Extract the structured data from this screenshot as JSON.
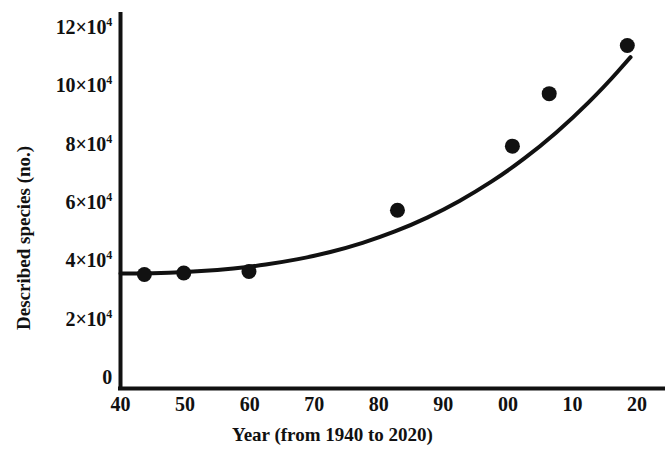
{
  "chart_data": {
    "type": "scatter",
    "title": "",
    "subtitle": "",
    "xlabel": "Year (from 1940 to 2020)",
    "ylabel": "Described species (no.)",
    "xlim": [
      40,
      120
    ],
    "ylim": [
      0,
      125000
    ],
    "grid": false,
    "legend": null,
    "x_tick_labels": [
      "40",
      "50",
      "60",
      "70",
      "80",
      "90",
      "00",
      "10",
      "20"
    ],
    "x_tick_values": [
      40,
      50,
      60,
      70,
      80,
      90,
      100,
      110,
      120
    ],
    "y_tick_labels": [
      "0",
      "2×10",
      "4×10",
      "6×10",
      "8×10",
      "10×10",
      "12×10"
    ],
    "y_tick_values": [
      0,
      20000,
      40000,
      60000,
      80000,
      100000,
      120000
    ],
    "y_tick_exponent": "4",
    "series": [
      {
        "name": "Described species",
        "marker": "filled-circle",
        "color": "#111111",
        "points": [
          {
            "x": 43.7,
            "y": 35500,
            "year": 1943
          },
          {
            "x": 49.8,
            "y": 36000,
            "year": 1950
          },
          {
            "x": 59.9,
            "y": 36500,
            "year": 1960
          },
          {
            "x": 82.9,
            "y": 57500,
            "year": 1983
          },
          {
            "x": 100.7,
            "y": 79500,
            "year": 2001
          },
          {
            "x": 106.4,
            "y": 97500,
            "year": 2006
          },
          {
            "x": 118.5,
            "y": 114000,
            "year": 2018
          }
        ]
      }
    ],
    "fit_curve": {
      "name": "exponential-trend",
      "color": "#111111",
      "points": [
        {
          "x": 40.0,
          "y": 35800
        },
        {
          "x": 45.0,
          "y": 35900
        },
        {
          "x": 50.0,
          "y": 36300
        },
        {
          "x": 55.0,
          "y": 37000
        },
        {
          "x": 60.0,
          "y": 38100
        },
        {
          "x": 65.0,
          "y": 39700
        },
        {
          "x": 70.0,
          "y": 41800
        },
        {
          "x": 75.0,
          "y": 44600
        },
        {
          "x": 80.0,
          "y": 48100
        },
        {
          "x": 85.0,
          "y": 52400
        },
        {
          "x": 90.0,
          "y": 57600
        },
        {
          "x": 95.0,
          "y": 63800
        },
        {
          "x": 100.0,
          "y": 71000
        },
        {
          "x": 105.0,
          "y": 79400
        },
        {
          "x": 110.0,
          "y": 89000
        },
        {
          "x": 115.0,
          "y": 100000
        },
        {
          "x": 119.0,
          "y": 110000
        }
      ]
    }
  },
  "axes": {
    "x_title": "Year (from 1940 to 2020)",
    "y_title": "Described species (no.)"
  },
  "yticks": [
    {
      "label": "12×10",
      "exp": "4"
    },
    {
      "label": "10×10",
      "exp": "4"
    },
    {
      "label": "8×10",
      "exp": "4"
    },
    {
      "label": "6×10",
      "exp": "4"
    },
    {
      "label": "4×10",
      "exp": "4"
    },
    {
      "label": "2×10",
      "exp": "4"
    },
    {
      "label": "0",
      "exp": ""
    }
  ],
  "xticks": [
    {
      "label": "40"
    },
    {
      "label": "50"
    },
    {
      "label": "60"
    },
    {
      "label": "70"
    },
    {
      "label": "80"
    },
    {
      "label": "90"
    },
    {
      "label": "00"
    },
    {
      "label": "10"
    },
    {
      "label": "20"
    }
  ]
}
